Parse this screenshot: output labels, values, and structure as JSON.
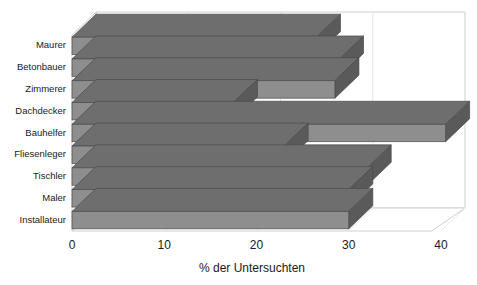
{
  "chart_data": {
    "type": "bar",
    "orientation": "horizontal",
    "style": "3d",
    "title": "",
    "subtitle": "",
    "xlabel": "% der Untersuchten",
    "ylabel": "",
    "xlim": [
      0,
      40
    ],
    "ylim": null,
    "xticks": [
      "0",
      "10",
      "20",
      "30",
      "40"
    ],
    "xtick_values": [
      0,
      10,
      20,
      30,
      40
    ],
    "grid": true,
    "grid_axis": "x",
    "legend": false,
    "legend_position": "none",
    "categories": [
      "Maurer",
      "Betonbauer",
      "Zimmerer",
      "Dachdecker",
      "Bauhelfer",
      "Fliesenleger",
      "Tischler",
      "Maler",
      "Installateur"
    ],
    "values": [
      26.5,
      29.0,
      28.5,
      17.5,
      40.5,
      23.0,
      32.0,
      30.0,
      30.0
    ],
    "series": [
      {
        "name": "% der Untersuchten",
        "values": [
          26.5,
          29.0,
          28.5,
          17.5,
          40.5,
          23.0,
          32.0,
          30.0,
          30.0
        ]
      }
    ],
    "annotations": []
  },
  "colors": {
    "bar_front": "#8e8e8e",
    "bar_top": "#6e6e6e",
    "bar_side": "#5a5a5a",
    "bar_outline": "#4a4a4a",
    "axis_line": "#b9b9b9",
    "grid_line": "#e6e6e6",
    "text": "#1a1a1a",
    "background": "#ffffff"
  }
}
